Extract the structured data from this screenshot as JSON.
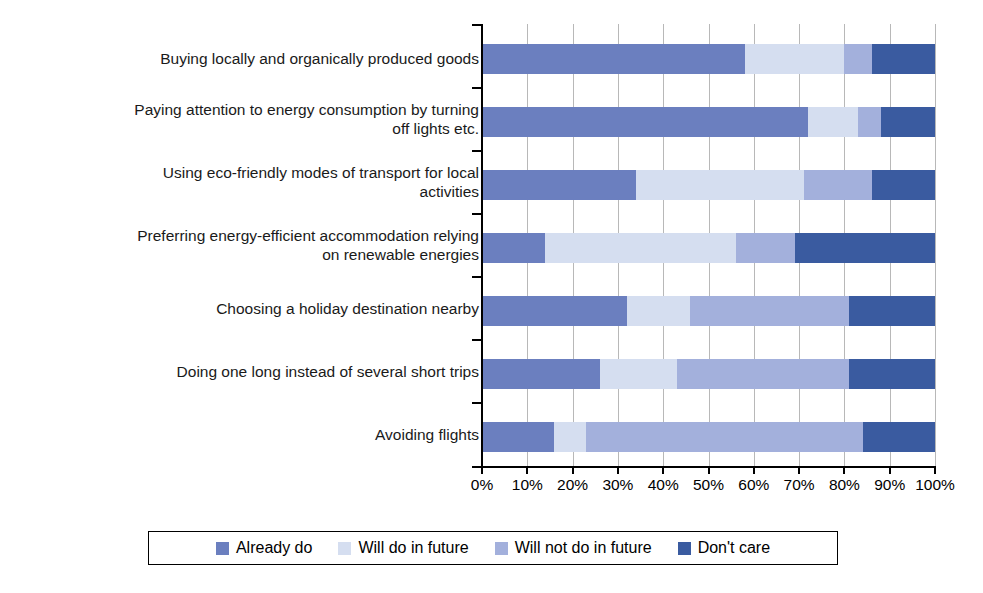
{
  "chart_data": {
    "type": "bar",
    "orientation": "horizontal",
    "stacked": true,
    "title": "",
    "subtitle": "",
    "xlabel": "",
    "ylabel": "",
    "xlim": [
      0,
      100
    ],
    "xticks": [
      0,
      10,
      20,
      30,
      40,
      50,
      60,
      70,
      80,
      90,
      100
    ],
    "xtick_labels": [
      "0%",
      "10%",
      "20%",
      "30%",
      "40%",
      "50%",
      "60%",
      "70%",
      "80%",
      "90%",
      "100%"
    ],
    "grid": true,
    "grid_axis": "x",
    "legend_position": "bottom",
    "categories": [
      "Buying locally and organically produced goods",
      "Paying attention to energy consumption by turning off lights etc.",
      "Using eco-friendly modes of transport for local activities",
      "Preferring energy-efficient accommodation relying on renewable energies",
      "Choosing a holiday destination nearby",
      "Doing one long instead of several short trips",
      "Avoiding flights"
    ],
    "series": [
      {
        "name": "Already do",
        "color": "#6B7FBF",
        "values": [
          58,
          72,
          34,
          14,
          32,
          26,
          16
        ]
      },
      {
        "name": "Will do in future",
        "color": "#D5DEF0",
        "values": [
          22,
          11,
          37,
          42,
          14,
          17,
          7
        ]
      },
      {
        "name": "Will not do in future",
        "color": "#A3B0DC",
        "values": [
          6,
          5,
          15,
          13,
          35,
          38,
          61
        ]
      },
      {
        "name": "Don't care",
        "color": "#3A5BA0",
        "values": [
          14,
          12,
          14,
          31,
          19,
          19,
          16
        ]
      }
    ]
  },
  "legend": {
    "items": [
      {
        "label": "Already do",
        "color": "#6B7FBF"
      },
      {
        "label": "Will do in future",
        "color": "#D5DEF0"
      },
      {
        "label": "Will not do in future",
        "color": "#A3B0DC"
      },
      {
        "label": "Don't care",
        "color": "#3A5BA0"
      }
    ]
  },
  "axis": {
    "tick_labels": [
      "0%",
      "10%",
      "20%",
      "30%",
      "40%",
      "50%",
      "60%",
      "70%",
      "80%",
      "90%",
      "100%"
    ]
  },
  "categories_display": [
    "Buying locally and organically produced goods",
    "Paying attention to energy consumption by turning\noff lights etc.",
    "Using eco-friendly modes of transport for local\nactivities",
    "Preferring energy-efficient accommodation relying\non renewable energies",
    "Choosing a holiday destination nearby",
    "Doing one long instead of several short trips",
    "Avoiding flights"
  ]
}
